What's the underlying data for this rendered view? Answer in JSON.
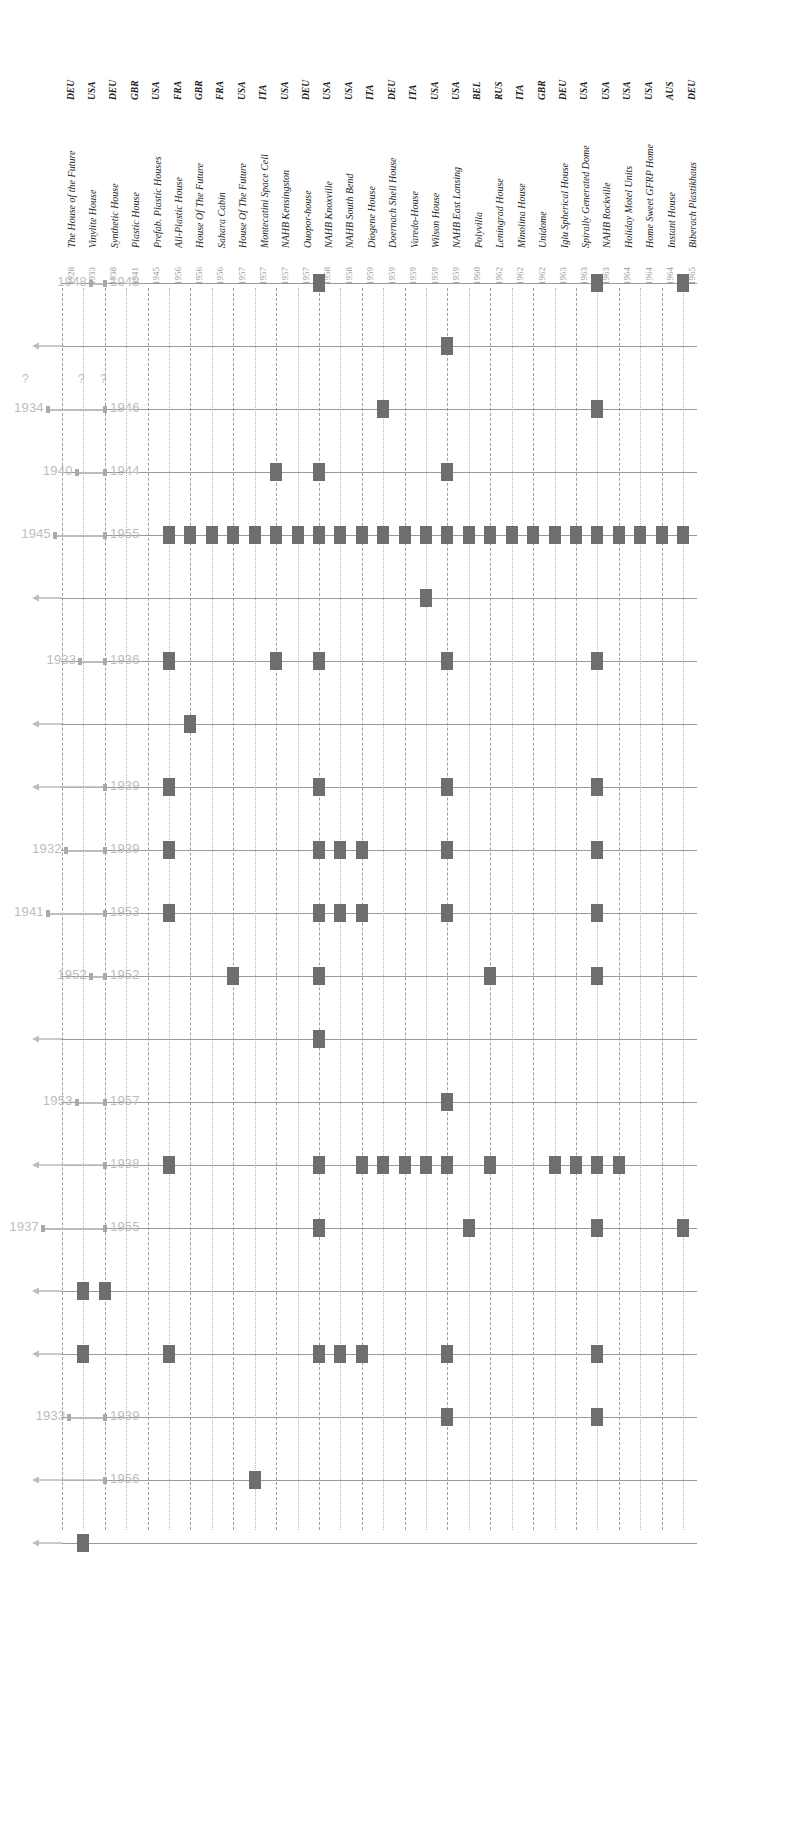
{
  "figure": {
    "caption": "",
    "colors": {
      "marker": "#6e6e6e",
      "grid": "#b4b4b4",
      "row_line": "#9a9a9a",
      "range_bar": "#bdbdbd",
      "label": "#bdbdbd",
      "header_text": "#1d1d1d",
      "year_text": "#9a9a9a"
    }
  },
  "columns": [
    {
      "country": "DEU",
      "name": "Biberach Plastikhaus",
      "year": "1965"
    },
    {
      "country": "AUS",
      "name": "Instant House",
      "year": "1964"
    },
    {
      "country": "USA",
      "name": "Home Sweet GFRP Home",
      "year": "1964"
    },
    {
      "country": "USA",
      "name": "Holiday Motel Units",
      "year": "1964"
    },
    {
      "country": "USA",
      "name": "NAHB Rockville",
      "year": "1963"
    },
    {
      "country": "USA",
      "name": "Spirally Generated Dome",
      "year": "1963"
    },
    {
      "country": "DEU",
      "name": "Iglu Spherical House",
      "year": "1963"
    },
    {
      "country": "GBR",
      "name": "Unidome",
      "year": "1962"
    },
    {
      "country": "ITA",
      "name": "Minolina House",
      "year": "1962"
    },
    {
      "country": "RUS",
      "name": "Leningrad House",
      "year": "1962"
    },
    {
      "country": "BEL",
      "name": "Polyvilla",
      "year": "1960"
    },
    {
      "country": "USA",
      "name": "NAHB East Lansing",
      "year": "1959"
    },
    {
      "country": "USA",
      "name": "Wilson House",
      "year": "1959"
    },
    {
      "country": "ITA",
      "name": "Varedo-House",
      "year": "1959"
    },
    {
      "country": "DEU",
      "name": "Doernach Shell House",
      "year": "1959"
    },
    {
      "country": "ITA",
      "name": "Diogene House",
      "year": "1959"
    },
    {
      "country": "USA",
      "name": "NAHB South Bend",
      "year": "1958"
    },
    {
      "country": "USA",
      "name": "NAHB Knoxville",
      "year": "1958"
    },
    {
      "country": "DEU",
      "name": "Ouopor-house",
      "year": "1957"
    },
    {
      "country": "USA",
      "name": "NAHB Kensingston",
      "year": "1957"
    },
    {
      "country": "ITA",
      "name": "Montecatini Space Cell",
      "year": "1957"
    },
    {
      "country": "USA",
      "name": "House Of The Future",
      "year": "1957"
    },
    {
      "country": "FRA",
      "name": "Sahara Cabin",
      "year": "1956"
    },
    {
      "country": "GBR",
      "name": "House Of The Future",
      "year": "1956"
    },
    {
      "country": "FRA",
      "name": "All-Plastic House",
      "year": "1956"
    },
    {
      "country": "USA",
      "name": "Prefab. Plastic Houses",
      "year": "1945"
    },
    {
      "country": "GBR",
      "name": "Plastic House",
      "year": "1941"
    },
    {
      "country": "DEU",
      "name": "Synthetic House",
      "year": "1938"
    },
    {
      "country": "USA",
      "name": "Vinylite House",
      "year": "1933"
    },
    {
      "country": "DEU",
      "name": "The House of the Future",
      "year": "1928"
    }
  ],
  "rows": [
    {
      "id": "r1",
      "start": "1948",
      "end": "1948",
      "kind": "range",
      "cells": [
        1,
        0,
        0,
        0,
        1,
        0,
        0,
        0,
        0,
        0,
        0,
        0,
        0,
        0,
        0,
        0,
        0,
        1,
        0,
        0,
        0,
        0,
        0,
        0,
        0,
        0,
        0,
        0,
        0,
        0
      ]
    },
    {
      "id": "r2",
      "start": "",
      "end": "",
      "kind": "arrow-left",
      "cells": [
        0,
        0,
        0,
        0,
        0,
        0,
        0,
        0,
        0,
        0,
        0,
        1,
        0,
        0,
        0,
        0,
        0,
        0,
        0,
        0,
        0,
        0,
        0,
        0,
        0,
        0,
        0,
        0,
        0,
        0
      ]
    },
    {
      "id": "r3",
      "start": "1934",
      "end": "1946",
      "kind": "range",
      "qmarks": true,
      "cells": [
        0,
        0,
        0,
        0,
        1,
        0,
        0,
        0,
        0,
        0,
        0,
        0,
        0,
        0,
        1,
        0,
        0,
        0,
        0,
        0,
        0,
        0,
        0,
        0,
        0,
        0,
        0,
        0,
        0,
        0
      ]
    },
    {
      "id": "r4",
      "start": "1940",
      "end": "1944",
      "kind": "range",
      "cells": [
        0,
        0,
        0,
        0,
        0,
        0,
        0,
        0,
        0,
        0,
        0,
        1,
        0,
        0,
        0,
        0,
        0,
        1,
        0,
        1,
        0,
        0,
        0,
        0,
        0,
        0,
        0,
        0,
        0,
        0
      ]
    },
    {
      "id": "r5",
      "start": "1945",
      "end": "1955",
      "kind": "range",
      "cells": [
        1,
        1,
        1,
        1,
        1,
        1,
        1,
        1,
        1,
        1,
        1,
        1,
        1,
        1,
        1,
        1,
        1,
        1,
        1,
        1,
        1,
        1,
        1,
        1,
        1,
        0,
        0,
        0,
        0,
        0
      ]
    },
    {
      "id": "r6",
      "start": "",
      "end": "",
      "kind": "arrow-left",
      "cells": [
        0,
        0,
        0,
        0,
        0,
        0,
        0,
        0,
        0,
        0,
        0,
        0,
        1,
        0,
        0,
        0,
        0,
        0,
        0,
        0,
        0,
        0,
        0,
        0,
        0,
        0,
        0,
        0,
        0,
        0
      ]
    },
    {
      "id": "r7",
      "start": "1933",
      "end": "1936",
      "kind": "range",
      "cells": [
        0,
        0,
        0,
        0,
        1,
        0,
        0,
        0,
        0,
        0,
        0,
        1,
        0,
        0,
        0,
        0,
        0,
        1,
        0,
        1,
        0,
        0,
        0,
        0,
        1,
        0,
        0,
        0,
        0,
        0
      ]
    },
    {
      "id": "r8",
      "start": "",
      "end": "",
      "kind": "arrow-left",
      "cells": [
        0,
        0,
        0,
        0,
        0,
        0,
        0,
        0,
        0,
        0,
        0,
        0,
        0,
        0,
        0,
        0,
        0,
        0,
        0,
        0,
        0,
        0,
        0,
        1,
        0,
        0,
        0,
        0,
        0,
        0
      ]
    },
    {
      "id": "r9",
      "start": "",
      "end": "1939",
      "kind": "arrow-left-end",
      "cells": [
        0,
        0,
        0,
        0,
        1,
        0,
        0,
        0,
        0,
        0,
        0,
        1,
        0,
        0,
        0,
        0,
        0,
        1,
        0,
        0,
        0,
        0,
        0,
        0,
        1,
        0,
        0,
        0,
        0,
        0
      ]
    },
    {
      "id": "r10",
      "start": "1932",
      "end": "1939",
      "kind": "range",
      "cells": [
        0,
        0,
        0,
        0,
        1,
        0,
        0,
        0,
        0,
        0,
        0,
        1,
        0,
        0,
        0,
        1,
        1,
        1,
        0,
        0,
        0,
        0,
        0,
        0,
        1,
        0,
        0,
        0,
        0,
        0
      ]
    },
    {
      "id": "r11",
      "start": "1941",
      "end": "1953",
      "kind": "range",
      "cells": [
        0,
        0,
        0,
        0,
        1,
        0,
        0,
        0,
        0,
        0,
        0,
        1,
        0,
        0,
        0,
        1,
        1,
        1,
        0,
        0,
        0,
        0,
        0,
        0,
        1,
        0,
        0,
        0,
        0,
        0
      ]
    },
    {
      "id": "r12",
      "start": "1952",
      "end": "1952",
      "kind": "range",
      "cells": [
        0,
        0,
        0,
        0,
        1,
        0,
        0,
        0,
        0,
        1,
        0,
        0,
        0,
        0,
        0,
        0,
        0,
        1,
        0,
        0,
        0,
        1,
        0,
        0,
        0,
        0,
        0,
        0,
        0,
        0
      ]
    },
    {
      "id": "r13",
      "start": "",
      "end": "",
      "kind": "arrow-left",
      "cells": [
        0,
        0,
        0,
        0,
        0,
        0,
        0,
        0,
        0,
        0,
        0,
        0,
        0,
        0,
        0,
        0,
        0,
        1,
        0,
        0,
        0,
        0,
        0,
        0,
        0,
        0,
        0,
        0,
        0,
        0
      ]
    },
    {
      "id": "r14",
      "start": "1953",
      "end": "1957",
      "kind": "range",
      "cells": [
        0,
        0,
        0,
        0,
        0,
        0,
        0,
        0,
        0,
        0,
        0,
        1,
        0,
        0,
        0,
        0,
        0,
        0,
        0,
        0,
        0,
        0,
        0,
        0,
        0,
        0,
        0,
        0,
        0,
        0
      ]
    },
    {
      "id": "r15",
      "start": "",
      "end": "1938",
      "kind": "arrow-left-end",
      "cells": [
        0,
        0,
        0,
        1,
        1,
        1,
        1,
        0,
        0,
        1,
        0,
        1,
        1,
        1,
        1,
        1,
        0,
        1,
        0,
        0,
        0,
        0,
        0,
        0,
        1,
        0,
        0,
        0,
        0,
        0
      ]
    },
    {
      "id": "r16",
      "start": "1937",
      "end": "1955",
      "kind": "range",
      "cells": [
        1,
        0,
        0,
        0,
        1,
        0,
        0,
        0,
        0,
        0,
        1,
        0,
        0,
        0,
        0,
        0,
        0,
        1,
        0,
        0,
        0,
        0,
        0,
        0,
        0,
        0,
        0,
        0,
        0,
        0
      ]
    },
    {
      "id": "r17",
      "start": "",
      "end": "",
      "kind": "arrow-left",
      "cells": [
        0,
        0,
        0,
        0,
        0,
        0,
        0,
        0,
        0,
        0,
        0,
        0,
        0,
        0,
        0,
        0,
        0,
        0,
        0,
        0,
        0,
        0,
        0,
        0,
        0,
        0,
        0,
        1,
        1,
        0
      ]
    },
    {
      "id": "r18",
      "start": "",
      "end": "",
      "kind": "arrow-left",
      "cells": [
        0,
        0,
        0,
        0,
        1,
        0,
        0,
        0,
        0,
        0,
        0,
        1,
        0,
        0,
        0,
        1,
        1,
        1,
        0,
        0,
        0,
        0,
        0,
        0,
        1,
        0,
        0,
        0,
        1,
        0
      ]
    },
    {
      "id": "r19",
      "start": "1933",
      "end": "1939",
      "kind": "range",
      "cells": [
        0,
        0,
        0,
        0,
        1,
        0,
        0,
        0,
        0,
        0,
        0,
        1,
        0,
        0,
        0,
        0,
        0,
        0,
        0,
        0,
        0,
        0,
        0,
        0,
        0,
        0,
        0,
        0,
        0,
        0
      ]
    },
    {
      "id": "r20",
      "start": "",
      "end": "1956",
      "kind": "arrow-left-end",
      "cells": [
        0,
        0,
        0,
        0,
        0,
        0,
        0,
        0,
        0,
        0,
        0,
        0,
        0,
        0,
        0,
        0,
        0,
        0,
        0,
        0,
        1,
        0,
        0,
        0,
        0,
        0,
        0,
        0,
        0,
        0
      ]
    },
    {
      "id": "r21",
      "start": "",
      "end": "",
      "kind": "arrow-left",
      "cells": [
        0,
        0,
        0,
        0,
        0,
        0,
        0,
        0,
        0,
        0,
        0,
        0,
        0,
        0,
        0,
        0,
        0,
        0,
        0,
        0,
        0,
        0,
        0,
        0,
        0,
        0,
        0,
        0,
        1,
        0
      ]
    }
  ],
  "chart_data": {
    "type": "heatmap",
    "title": "",
    "xlabel": "",
    "ylabel": "",
    "grid": true,
    "legend": "none",
    "x_categories": [
      "Biberach Plastikhaus 1965",
      "Instant House 1964",
      "Home Sweet GFRP Home 1964",
      "Holiday Motel Units 1964",
      "NAHB Rockville 1963",
      "Spirally Generated Dome 1963",
      "Iglu Spherical House 1963",
      "Unidome 1962",
      "Minolina House 1962",
      "Leningrad House 1962",
      "Polyvilla 1960",
      "NAHB East Lansing 1959",
      "Wilson House 1959",
      "Varedo-House 1959",
      "Doernach Shell House 1959",
      "Diogene House 1959",
      "NAHB South Bend 1958",
      "NAHB Knoxville 1958",
      "Ouopor-house 1957",
      "NAHB Kensingston 1957",
      "Montecatini Space Cell 1957",
      "House Of The Future 1957",
      "Sahara Cabin 1956",
      "House Of The Future 1956",
      "All-Plastic House 1956",
      "Prefab. Plastic Houses 1945",
      "Plastic House 1941",
      "Synthetic House 1938",
      "Vinylite House 1933",
      "The House of the Future 1928"
    ],
    "y_categories": [
      "1948–1948",
      "open",
      "1934–1946",
      "1940–1944",
      "1945–1955",
      "open",
      "1933–1936",
      "open",
      "–1939",
      "1932–1939",
      "1941–1953",
      "1952–1952",
      "open",
      "1953–1957",
      "–1938",
      "1937–1955",
      "open",
      "open",
      "1933–1939",
      "–1956",
      "open"
    ],
    "note": "Binary presence matrix; 1 = marker drawn at (row, column)."
  }
}
